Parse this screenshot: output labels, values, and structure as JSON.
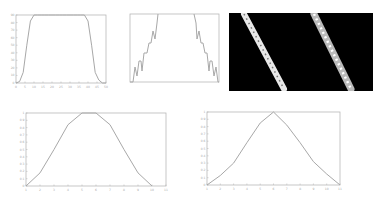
{
  "chart_data": [
    {
      "type": "line",
      "title": "",
      "xlabel": "",
      "ylabel": "",
      "x": [
        0,
        2,
        4,
        6,
        8,
        10,
        12,
        14,
        16,
        18,
        20,
        22,
        24,
        26,
        28,
        30,
        32,
        34,
        36,
        38,
        40,
        42,
        44,
        46,
        48,
        50
      ],
      "values": [
        0,
        2,
        14,
        50,
        82,
        90,
        90,
        90,
        90,
        90,
        90,
        90,
        90,
        90,
        90,
        90,
        90,
        90,
        90,
        90,
        82,
        50,
        14,
        4,
        0,
        0
      ],
      "xlim": [
        0,
        50
      ],
      "ylim": [
        0,
        90
      ],
      "xticks": [
        "0",
        "5",
        "10",
        "15",
        "20",
        "25",
        "30",
        "35",
        "40",
        "45",
        "50"
      ],
      "yticks": [
        "0",
        "10",
        "20",
        "30",
        "40",
        "50",
        "60",
        "70",
        "80",
        "90"
      ],
      "grid": false
    },
    {
      "type": "line",
      "title": "",
      "x": [
        0,
        1,
        2,
        3,
        4,
        5,
        6,
        7,
        8,
        9,
        10,
        11,
        12,
        13,
        14,
        15,
        16,
        17,
        18,
        19,
        20
      ],
      "values": [
        0,
        1,
        0,
        2,
        1,
        2,
        2,
        3,
        3,
        4,
        5,
        4,
        3,
        3,
        2,
        2,
        1,
        2,
        0,
        1,
        0
      ],
      "note": "jagged symmetric profile clipped at top",
      "grid": false
    },
    {
      "type": "heatmap",
      "title": "",
      "description": "Black image with two diagonal bright dotted stripes",
      "stripes": 2,
      "colors": {
        "background": "#000000",
        "stripe": "#f2f2f2"
      }
    },
    {
      "type": "line",
      "title": "",
      "x": [
        1,
        2,
        3,
        4,
        5,
        6,
        7,
        8,
        9,
        10
      ],
      "values": [
        0,
        0.18,
        0.5,
        0.84,
        1,
        1,
        0.84,
        0.5,
        0.18,
        0
      ],
      "xlim": [
        1,
        11
      ],
      "ylim": [
        0,
        1
      ],
      "xticks": [
        "1",
        "2",
        "3",
        "4",
        "5",
        "6",
        "7",
        "8",
        "9",
        "10",
        "11"
      ],
      "yticks": [
        "0",
        "0.1",
        "0.2",
        "0.3",
        "0.4",
        "0.5",
        "0.6",
        "0.7",
        "0.8",
        "0.9",
        "1"
      ],
      "grid": false
    },
    {
      "type": "line",
      "title": "",
      "x": [
        1,
        2,
        3,
        4,
        5,
        6,
        7,
        8,
        9,
        10,
        11
      ],
      "values": [
        0,
        0.13,
        0.3,
        0.58,
        0.85,
        1,
        0.82,
        0.58,
        0.32,
        0.15,
        0
      ],
      "xlim": [
        1,
        11
      ],
      "ylim": [
        0,
        1
      ],
      "xticks": [
        "1",
        "2",
        "3",
        "4",
        "5",
        "6",
        "7",
        "8",
        "9",
        "10",
        "11"
      ],
      "yticks": [
        "0",
        "0.1",
        "0.2",
        "0.3",
        "0.4",
        "0.5",
        "0.6",
        "0.7",
        "0.8",
        "0.9",
        "1"
      ],
      "grid": false
    }
  ]
}
